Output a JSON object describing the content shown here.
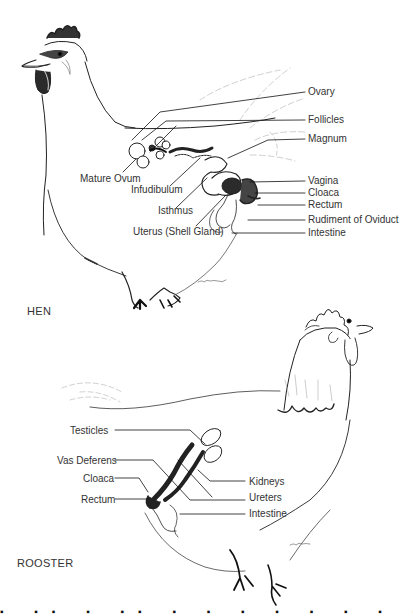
{
  "hen": {
    "title": "HEN",
    "labels_right": [
      {
        "text": "Ovary",
        "y": 92
      },
      {
        "text": "Follicles",
        "y": 120
      },
      {
        "text": "Magnum",
        "y": 138
      },
      {
        "text": "Vagina",
        "y": 180
      },
      {
        "text": "Cloaca",
        "y": 192
      },
      {
        "text": "Rectum",
        "y": 205
      },
      {
        "text": "Rudiment of Oviduct",
        "y": 220
      },
      {
        "text": "Intestine",
        "y": 232
      }
    ],
    "labels_left": [
      {
        "text": "Mature Ovum",
        "x": 80,
        "y": 178
      },
      {
        "text": "Infudibulum",
        "x": 131,
        "y": 189
      },
      {
        "text": "Isthmus",
        "x": 158,
        "y": 210
      },
      {
        "text": "Uterus (Shell Gland)",
        "x": 133,
        "y": 231
      }
    ],
    "signature": "C. Hagman"
  },
  "rooster": {
    "title": "ROOSTER",
    "labels_left": [
      {
        "text": "Testicles",
        "y": 430
      },
      {
        "text": "Vas Deferens",
        "y": 460
      },
      {
        "text": "Cloaca",
        "y": 479
      },
      {
        "text": "Rectum",
        "y": 499
      }
    ],
    "labels_right": [
      {
        "text": "Kidneys",
        "y": 481
      },
      {
        "text": "Ureters",
        "y": 497
      },
      {
        "text": "Intestine",
        "y": 513
      }
    ],
    "signature": "C. Hagman"
  },
  "caption_partial": "▪ ▪▪ ▪ ▪▪ ▪ ▪ ▪ ▪ ▪ ▪ ▪ ▪"
}
